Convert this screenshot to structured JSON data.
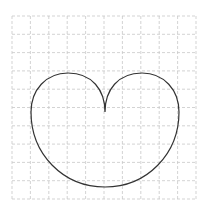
{
  "figure": {
    "grid": {
      "rows": 10,
      "cols": 10,
      "x0": 12,
      "y0": 16,
      "x1": 196,
      "y1": 199,
      "line_color": "#c8c8c8",
      "dash": "3,2"
    },
    "curve": {
      "shape": "heart",
      "stroke_color": "#333333",
      "stroke_width": 1.2,
      "cusp": [
        105,
        112
      ],
      "bottom": [
        105,
        187
      ],
      "left_extent": [
        31,
        112
      ],
      "right_extent": [
        179,
        112
      ],
      "left_lobe_top": [
        68,
        73
      ],
      "right_lobe_top": [
        142,
        73
      ]
    }
  }
}
